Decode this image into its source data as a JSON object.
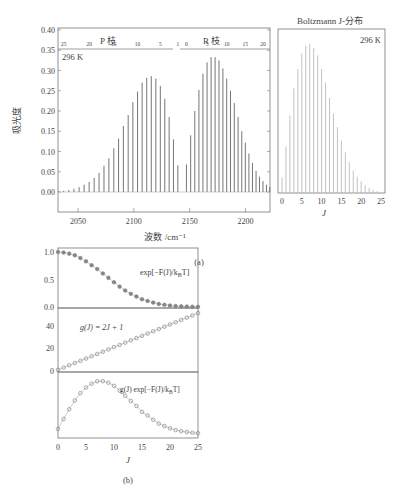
{
  "figure": {
    "panel_a_label": "(a)",
    "panel_b_label": "(b)",
    "caption_partial": "图 ... CO 的振转吸收光谱与 Boltzmann J-分布..."
  },
  "chart_data": [
    {
      "type": "bar",
      "id": "co-rovibrational-spectrum",
      "title": "",
      "xlabel": "波数 /cm⁻¹",
      "ylabel": "吸光度",
      "annotation": "296 K",
      "xlim": [
        2032,
        2222
      ],
      "ylim": [
        0.0,
        0.4
      ],
      "xticks": [
        2050,
        2100,
        2150,
        2200
      ],
      "yticks": [
        0.0,
        0.05,
        0.1,
        0.15,
        0.2,
        0.25,
        0.3,
        0.35,
        0.4
      ],
      "ytick_labels": [
        "0.00",
        "0.05",
        "0.10",
        "0.15",
        "0.20",
        "0.25",
        "0.30",
        "0.35",
        "0.40"
      ],
      "top_axis": {
        "P_branch_label": "P 枝",
        "R_branch_label": "R 枝",
        "P_ticks": [
          25,
          20,
          15,
          10,
          5,
          1
        ],
        "R_ticks": [
          0,
          5,
          10,
          15,
          20
        ]
      },
      "series": [
        {
          "name": "P branch",
          "J": [
            1,
            2,
            3,
            4,
            5,
            6,
            7,
            8,
            9,
            10,
            11,
            12,
            13,
            14,
            15,
            16,
            17,
            18,
            19,
            20,
            21,
            22,
            23,
            24,
            25,
            26,
            27
          ],
          "x": [
            2139.4,
            2135.5,
            2131.6,
            2127.7,
            2123.7,
            2119.7,
            2115.6,
            2111.5,
            2107.4,
            2103.3,
            2099.1,
            2094.9,
            2090.6,
            2086.3,
            2082.0,
            2077.6,
            2073.2,
            2068.8,
            2064.4,
            2059.9,
            2055.4,
            2050.9,
            2046.3,
            2041.7,
            2037.1,
            2032.5,
            2028.0
          ],
          "values": [
            0.066,
            0.13,
            0.185,
            0.23,
            0.262,
            0.28,
            0.286,
            0.282,
            0.27,
            0.248,
            0.222,
            0.19,
            0.163,
            0.132,
            0.108,
            0.083,
            0.065,
            0.047,
            0.035,
            0.025,
            0.018,
            0.012,
            0.008,
            0.005,
            0.003,
            0.002,
            0.001
          ]
        },
        {
          "name": "R branch",
          "J": [
            0,
            1,
            2,
            3,
            4,
            5,
            6,
            7,
            8,
            9,
            10,
            11,
            12,
            13,
            14,
            15,
            16,
            17,
            18,
            19,
            20,
            21,
            22,
            23,
            24
          ],
          "x": [
            2147.1,
            2150.9,
            2154.6,
            2158.3,
            2161.9,
            2165.6,
            2169.2,
            2172.8,
            2176.3,
            2179.8,
            2183.2,
            2186.6,
            2190.0,
            2193.4,
            2196.7,
            2199.9,
            2203.1,
            2206.3,
            2209.5,
            2212.6,
            2215.7,
            2218.8,
            2221.8,
            2224.8,
            2227.7
          ],
          "values": [
            0.068,
            0.14,
            0.2,
            0.252,
            0.292,
            0.32,
            0.333,
            0.333,
            0.325,
            0.305,
            0.28,
            0.25,
            0.22,
            0.185,
            0.15,
            0.122,
            0.095,
            0.072,
            0.052,
            0.038,
            0.027,
            0.018,
            0.012,
            0.008,
            0.005
          ]
        }
      ]
    },
    {
      "type": "bar",
      "id": "boltzmann-j-distribution",
      "title": "Boltzmann J-分布",
      "xlabel": "J",
      "ylabel": "",
      "annotation": "296 K",
      "xlim": [
        0,
        25
      ],
      "xticks": [
        0,
        5,
        10,
        15,
        20,
        25
      ],
      "categories": [
        0,
        1,
        2,
        3,
        4,
        5,
        6,
        7,
        8,
        9,
        10,
        11,
        12,
        13,
        14,
        15,
        16,
        17,
        18,
        19,
        20,
        21,
        22,
        23,
        24,
        25
      ],
      "values": [
        0.04,
        0.12,
        0.2,
        0.27,
        0.32,
        0.36,
        0.38,
        0.385,
        0.375,
        0.355,
        0.32,
        0.285,
        0.245,
        0.205,
        0.17,
        0.135,
        0.105,
        0.08,
        0.058,
        0.042,
        0.03,
        0.02,
        0.013,
        0.008,
        0.005,
        0.003
      ]
    },
    {
      "type": "scatter",
      "id": "boltzmann-factor",
      "annotation": "exp[−F(J)/k_BT]",
      "xlim": [
        0,
        25
      ],
      "ylim": [
        0,
        1.0
      ],
      "yticks": [
        0.0,
        0.5,
        1.0
      ],
      "ytick_labels": [
        "0.0",
        "0.5",
        "1.0"
      ],
      "marker": "filled-circle",
      "x": [
        0,
        1,
        2,
        3,
        4,
        5,
        6,
        7,
        8,
        9,
        10,
        11,
        12,
        13,
        14,
        15,
        16,
        17,
        18,
        19,
        20,
        21,
        22,
        23,
        24,
        25
      ],
      "values": [
        1.0,
        0.99,
        0.97,
        0.94,
        0.89,
        0.83,
        0.76,
        0.69,
        0.61,
        0.53,
        0.45,
        0.37,
        0.3,
        0.24,
        0.19,
        0.14,
        0.11,
        0.08,
        0.055,
        0.04,
        0.027,
        0.018,
        0.012,
        0.008,
        0.005,
        0.003
      ]
    },
    {
      "type": "scatter",
      "id": "degeneracy",
      "annotation": "g(J) = 2J + 1",
      "xlim": [
        0,
        25
      ],
      "ylim": [
        0,
        52
      ],
      "yticks": [
        0,
        20,
        40
      ],
      "ytick_labels": [
        "0",
        "20",
        "40"
      ],
      "marker": "open-circle",
      "x": [
        0,
        1,
        2,
        3,
        4,
        5,
        6,
        7,
        8,
        9,
        10,
        11,
        12,
        13,
        14,
        15,
        16,
        17,
        18,
        19,
        20,
        21,
        22,
        23,
        24,
        25
      ],
      "values": [
        1,
        3,
        5,
        7,
        9,
        11,
        13,
        15,
        17,
        19,
        21,
        23,
        25,
        27,
        29,
        31,
        33,
        35,
        37,
        39,
        41,
        43,
        45,
        47,
        49,
        51
      ]
    },
    {
      "type": "scatter",
      "id": "population",
      "annotation": "g(J) exp[−F(J)/k_BT]",
      "xlabel": "J",
      "xlim": [
        0,
        25
      ],
      "xticks": [
        0,
        5,
        10,
        15,
        20,
        25
      ],
      "marker": "open-circle-line",
      "x": [
        0,
        1,
        2,
        3,
        4,
        5,
        6,
        7,
        8,
        9,
        10,
        11,
        12,
        13,
        14,
        15,
        16,
        17,
        18,
        19,
        20,
        21,
        22,
        23,
        24,
        25
      ],
      "values": [
        1.0,
        2.97,
        4.85,
        6.58,
        8.01,
        9.13,
        9.88,
        10.35,
        10.37,
        10.07,
        9.45,
        8.51,
        7.5,
        6.48,
        5.51,
        4.34,
        3.63,
        2.8,
        2.04,
        1.56,
        1.11,
        0.77,
        0.54,
        0.38,
        0.25,
        0.15
      ]
    }
  ]
}
